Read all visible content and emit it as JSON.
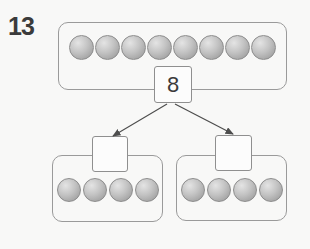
{
  "worksheet": {
    "problem_number": "13",
    "number_bond": {
      "whole": {
        "value": "8",
        "counters": 8
      },
      "parts": [
        {
          "value": "",
          "counters": 4
        },
        {
          "value": "",
          "counters": 4
        }
      ]
    }
  },
  "colors": {
    "background": "#f8f8f7",
    "outline": "#9a9a9a",
    "box_outline": "#8f8f8f",
    "box_fill": "#fcfcfc",
    "arrow": "#4d4d4d",
    "text": "#3b3b3b",
    "counter_hi": "#e4e4e4",
    "counter_mid": "#c3c3c3",
    "counter_lo": "#939393",
    "counter_edge": "#8d8d8d"
  }
}
